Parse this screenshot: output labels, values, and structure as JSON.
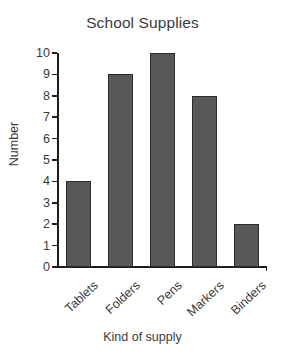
{
  "chart_data": {
    "type": "bar",
    "title": "School Supplies",
    "xlabel": "Kind of supply",
    "ylabel": "Number",
    "categories": [
      "Tablets",
      "Folders",
      "Pens",
      "Markers",
      "Binders"
    ],
    "values": [
      4,
      9,
      10,
      8,
      2
    ],
    "ylim": [
      0,
      10
    ],
    "yticks": [
      0,
      1,
      2,
      3,
      4,
      5,
      6,
      7,
      8,
      9,
      10
    ],
    "ytick_labels": [
      "0",
      "1",
      "2",
      "3",
      "4",
      "5",
      "6",
      "7",
      "8",
      "9",
      "10"
    ],
    "grid": false,
    "legend": null,
    "bar_color": "#585858",
    "bar_edge_color": "#2b2b2b",
    "axis_color": "#1d1d1d",
    "text_color": "#3b3b3b",
    "background": "#ffffff",
    "xtick_label_rotation": -43
  }
}
